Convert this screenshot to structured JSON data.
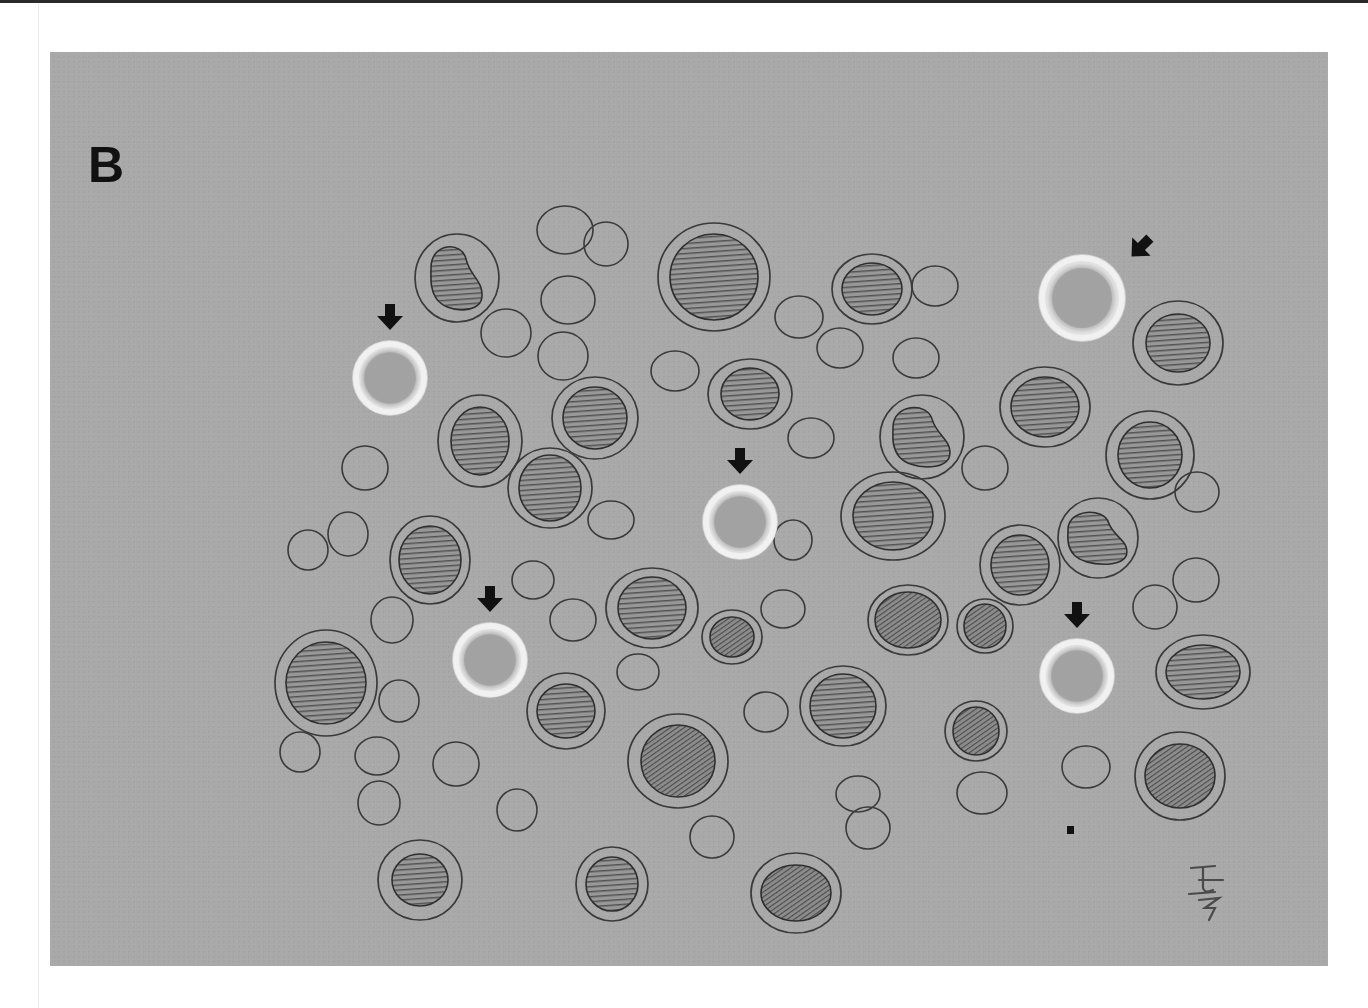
{
  "figure": {
    "panel_label": "B",
    "background_color": "#a9a9a9",
    "outline_color": "#3a3a3a",
    "nucleus_fill": "#8f8f8f",
    "highlight_cell_color": "#e8e8e8",
    "arrow_color": "#111111"
  },
  "legend": {
    "highlighted_cells": "Cells marked with arrows (pale, ring-shaped)",
    "hatched_cells": "Nucleated cells with hatched nuclei",
    "empty_cells": "Small anucleate cells (outlines)"
  },
  "highlighted_cells": [
    {
      "cx": 390,
      "cy": 378,
      "r": 38,
      "arrow": "down"
    },
    {
      "cx": 1082,
      "cy": 298,
      "r": 44,
      "arrow": "down-left"
    },
    {
      "cx": 740,
      "cy": 522,
      "r": 38,
      "arrow": "down"
    },
    {
      "cx": 490,
      "cy": 660,
      "r": 38,
      "arrow": "down"
    },
    {
      "cx": 1077,
      "cy": 676,
      "r": 38,
      "arrow": "down"
    }
  ],
  "nucleated_cells": [
    {
      "cx": 457,
      "cy": 278,
      "rx": 42,
      "ry": 44,
      "nrx": 26,
      "nry": 34,
      "shape": "kidney"
    },
    {
      "cx": 714,
      "cy": 277,
      "rx": 56,
      "ry": 54,
      "nrx": 44,
      "nry": 43,
      "shape": "round"
    },
    {
      "cx": 872,
      "cy": 289,
      "rx": 40,
      "ry": 35,
      "nrx": 30,
      "nry": 26,
      "shape": "round"
    },
    {
      "cx": 1178,
      "cy": 343,
      "rx": 45,
      "ry": 42,
      "nrx": 32,
      "nry": 29,
      "shape": "round"
    },
    {
      "cx": 750,
      "cy": 394,
      "rx": 42,
      "ry": 35,
      "nrx": 29,
      "nry": 26,
      "shape": "round"
    },
    {
      "cx": 595,
      "cy": 418,
      "rx": 43,
      "ry": 41,
      "nrx": 32,
      "nry": 31,
      "shape": "round"
    },
    {
      "cx": 480,
      "cy": 441,
      "rx": 42,
      "ry": 46,
      "nrx": 29,
      "nry": 34,
      "shape": "round"
    },
    {
      "cx": 1045,
      "cy": 407,
      "rx": 45,
      "ry": 40,
      "nrx": 34,
      "nry": 30,
      "shape": "round"
    },
    {
      "cx": 922,
      "cy": 437,
      "rx": 42,
      "ry": 42,
      "nrx": 29,
      "nry": 32,
      "shape": "kidney"
    },
    {
      "cx": 1150,
      "cy": 455,
      "rx": 44,
      "ry": 44,
      "nrx": 32,
      "nry": 33,
      "shape": "round"
    },
    {
      "cx": 550,
      "cy": 488,
      "rx": 42,
      "ry": 40,
      "nrx": 31,
      "nry": 33,
      "shape": "round"
    },
    {
      "cx": 893,
      "cy": 516,
      "rx": 52,
      "ry": 44,
      "nrx": 40,
      "nry": 34,
      "shape": "round"
    },
    {
      "cx": 1020,
      "cy": 565,
      "rx": 40,
      "ry": 40,
      "nrx": 29,
      "nry": 30,
      "shape": "round"
    },
    {
      "cx": 1098,
      "cy": 538,
      "rx": 40,
      "ry": 40,
      "nrx": 30,
      "nry": 28,
      "shape": "kidney"
    },
    {
      "cx": 430,
      "cy": 560,
      "rx": 40,
      "ry": 44,
      "nrx": 31,
      "nry": 34,
      "shape": "round"
    },
    {
      "cx": 652,
      "cy": 608,
      "rx": 46,
      "ry": 40,
      "nrx": 34,
      "nry": 31,
      "shape": "round"
    },
    {
      "cx": 732,
      "cy": 637,
      "rx": 30,
      "ry": 27,
      "nrx": 22,
      "nry": 20,
      "shape": "round",
      "dense": true
    },
    {
      "cx": 908,
      "cy": 620,
      "rx": 40,
      "ry": 35,
      "nrx": 33,
      "nry": 28,
      "shape": "round",
      "dense": true
    },
    {
      "cx": 985,
      "cy": 626,
      "rx": 28,
      "ry": 27,
      "nrx": 21,
      "nry": 22,
      "shape": "round",
      "dense": true
    },
    {
      "cx": 326,
      "cy": 683,
      "rx": 51,
      "ry": 53,
      "nrx": 40,
      "nry": 41,
      "shape": "round"
    },
    {
      "cx": 1203,
      "cy": 672,
      "rx": 47,
      "ry": 37,
      "nrx": 37,
      "nry": 27,
      "shape": "round"
    },
    {
      "cx": 566,
      "cy": 711,
      "rx": 39,
      "ry": 38,
      "nrx": 29,
      "nry": 27,
      "shape": "round"
    },
    {
      "cx": 843,
      "cy": 706,
      "rx": 43,
      "ry": 40,
      "nrx": 33,
      "nry": 32,
      "shape": "round"
    },
    {
      "cx": 976,
      "cy": 731,
      "rx": 31,
      "ry": 30,
      "nrx": 23,
      "nry": 24,
      "shape": "round",
      "dense": true
    },
    {
      "cx": 678,
      "cy": 761,
      "rx": 50,
      "ry": 47,
      "nrx": 37,
      "nry": 36,
      "shape": "round",
      "dense": true
    },
    {
      "cx": 1180,
      "cy": 776,
      "rx": 45,
      "ry": 44,
      "nrx": 35,
      "nry": 32,
      "shape": "round",
      "dense": true
    },
    {
      "cx": 420,
      "cy": 880,
      "rx": 42,
      "ry": 40,
      "nrx": 28,
      "nry": 26,
      "shape": "round"
    },
    {
      "cx": 612,
      "cy": 884,
      "rx": 36,
      "ry": 37,
      "nrx": 26,
      "nry": 27,
      "shape": "round"
    },
    {
      "cx": 796,
      "cy": 893,
      "rx": 45,
      "ry": 40,
      "nrx": 35,
      "nry": 28,
      "shape": "round",
      "dense": true
    }
  ],
  "empty_cells": [
    {
      "cx": 565,
      "cy": 230,
      "rx": 28,
      "ry": 24
    },
    {
      "cx": 606,
      "cy": 244,
      "rx": 22,
      "ry": 22
    },
    {
      "cx": 935,
      "cy": 286,
      "rx": 23,
      "ry": 20
    },
    {
      "cx": 568,
      "cy": 300,
      "rx": 27,
      "ry": 24
    },
    {
      "cx": 506,
      "cy": 333,
      "rx": 25,
      "ry": 24
    },
    {
      "cx": 799,
      "cy": 317,
      "rx": 24,
      "ry": 21
    },
    {
      "cx": 840,
      "cy": 348,
      "rx": 23,
      "ry": 20
    },
    {
      "cx": 916,
      "cy": 358,
      "rx": 23,
      "ry": 20
    },
    {
      "cx": 563,
      "cy": 356,
      "rx": 25,
      "ry": 24
    },
    {
      "cx": 675,
      "cy": 371,
      "rx": 24,
      "ry": 20
    },
    {
      "cx": 811,
      "cy": 438,
      "rx": 23,
      "ry": 20
    },
    {
      "cx": 365,
      "cy": 468,
      "rx": 23,
      "ry": 22
    },
    {
      "cx": 985,
      "cy": 468,
      "rx": 23,
      "ry": 22
    },
    {
      "cx": 1197,
      "cy": 492,
      "rx": 22,
      "ry": 20
    },
    {
      "cx": 611,
      "cy": 520,
      "rx": 23,
      "ry": 19
    },
    {
      "cx": 308,
      "cy": 550,
      "rx": 20,
      "ry": 20
    },
    {
      "cx": 348,
      "cy": 534,
      "rx": 20,
      "ry": 22
    },
    {
      "cx": 793,
      "cy": 540,
      "rx": 19,
      "ry": 20
    },
    {
      "cx": 533,
      "cy": 580,
      "rx": 21,
      "ry": 19
    },
    {
      "cx": 1196,
      "cy": 580,
      "rx": 23,
      "ry": 22
    },
    {
      "cx": 392,
      "cy": 620,
      "rx": 21,
      "ry": 23
    },
    {
      "cx": 783,
      "cy": 609,
      "rx": 22,
      "ry": 19
    },
    {
      "cx": 573,
      "cy": 620,
      "rx": 23,
      "ry": 21
    },
    {
      "cx": 1155,
      "cy": 607,
      "rx": 22,
      "ry": 22
    },
    {
      "cx": 638,
      "cy": 672,
      "rx": 21,
      "ry": 18
    },
    {
      "cx": 399,
      "cy": 701,
      "rx": 20,
      "ry": 21
    },
    {
      "cx": 766,
      "cy": 712,
      "rx": 22,
      "ry": 20
    },
    {
      "cx": 300,
      "cy": 752,
      "rx": 20,
      "ry": 20
    },
    {
      "cx": 377,
      "cy": 756,
      "rx": 22,
      "ry": 19
    },
    {
      "cx": 456,
      "cy": 764,
      "rx": 23,
      "ry": 22
    },
    {
      "cx": 1086,
      "cy": 767,
      "rx": 24,
      "ry": 21
    },
    {
      "cx": 379,
      "cy": 803,
      "rx": 21,
      "ry": 22
    },
    {
      "cx": 517,
      "cy": 810,
      "rx": 20,
      "ry": 21
    },
    {
      "cx": 858,
      "cy": 794,
      "rx": 22,
      "ry": 18
    },
    {
      "cx": 982,
      "cy": 793,
      "rx": 25,
      "ry": 21
    },
    {
      "cx": 712,
      "cy": 837,
      "rx": 22,
      "ry": 21
    },
    {
      "cx": 868,
      "cy": 828,
      "rx": 22,
      "ry": 21
    }
  ],
  "marks": {
    "small_square": {
      "x": 1067,
      "y": 826,
      "w": 7,
      "h": 8
    }
  },
  "signature": {
    "text": "signature monogram"
  }
}
